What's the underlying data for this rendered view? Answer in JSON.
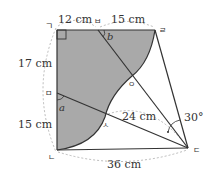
{
  "points": {
    "g": {
      "label": "ㄱ",
      "x": 57,
      "y": 30
    },
    "n": {
      "label": "ㄴ",
      "x": 57,
      "y": 150
    },
    "d": {
      "label": "ㄷ",
      "x": 188,
      "y": 148
    },
    "r": {
      "label": "ㄹ",
      "x": 155,
      "y": 30
    },
    "b": {
      "label": "ㅂ",
      "x": 98,
      "y": 30
    },
    "m": {
      "label": "ㅁ",
      "x": 57,
      "y": 93
    },
    "o": {
      "label": "ㅇ",
      "x": 132,
      "y": 76
    },
    "s": {
      "label": "ㅅ",
      "x": 105,
      "y": 117
    }
  },
  "measurements": {
    "top_left": "12 cm",
    "top_right": "15 cm",
    "left_upper": "17 cm",
    "left_lower": "15 cm",
    "diagonal": "24 cm",
    "bottom": "36 cm",
    "angle": "30°"
  },
  "angle_labels": {
    "a": "a",
    "b": "b"
  },
  "colors": {
    "shade": "#a9a9a9",
    "line": "#333333",
    "dashed": "#aaaaaa"
  }
}
